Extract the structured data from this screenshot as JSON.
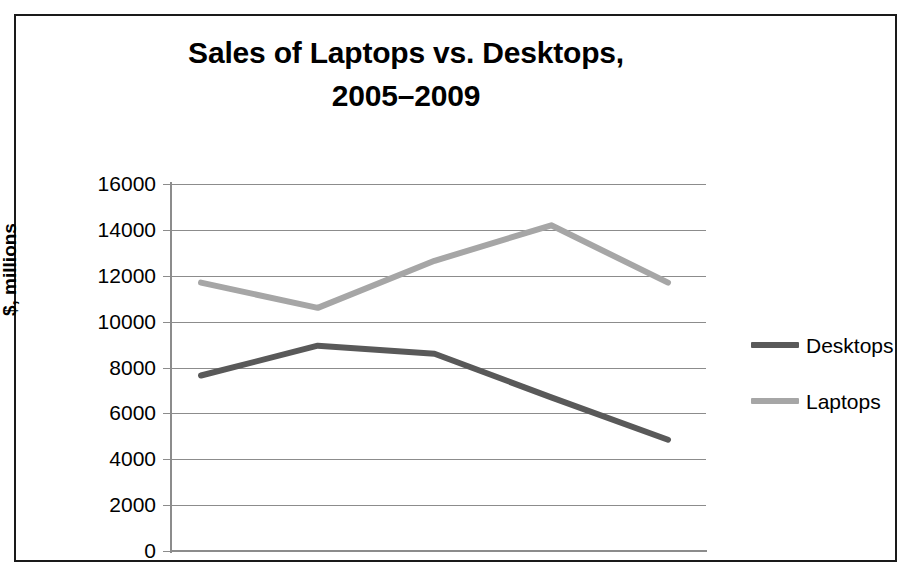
{
  "chart_data": {
    "type": "line",
    "title": "Sales of Laptops vs. Desktops, 2005–2009",
    "title_lines": [
      "Sales of Laptops vs. Desktops,",
      "2005–2009"
    ],
    "xlabel": "",
    "ylabel": "$, millions",
    "x": [
      "2005",
      "2006",
      "2007",
      "2008",
      "2009"
    ],
    "categories": [
      "2005",
      "2006",
      "2007",
      "2008",
      "2009"
    ],
    "series": [
      {
        "name": "Desktops",
        "color": "#595959",
        "values": [
          7650,
          8950,
          8600,
          6700,
          4850
        ]
      },
      {
        "name": "Laptops",
        "color": "#a6a6a6",
        "values": [
          11700,
          10600,
          12650,
          14200,
          11700
        ]
      }
    ],
    "ylim": [
      0,
      16000
    ],
    "ytick_step": 2000,
    "ytick_labels": [
      "16000",
      "14000",
      "12000",
      "10000",
      "8000",
      "6000",
      "4000",
      "2000",
      "0"
    ],
    "ytick_values": [
      16000,
      14000,
      12000,
      10000,
      8000,
      6000,
      4000,
      2000,
      0
    ],
    "xtick_labels": [],
    "grid": "horizontal",
    "legend_position": "right",
    "frame_color": "#1a1a1a",
    "grid_color": "#8c8c8c",
    "axis_color": "#8c8c8c",
    "background": "#ffffff"
  },
  "legend": {
    "items": [
      {
        "label": "Desktops",
        "color": "#595959"
      },
      {
        "label": "Laptops",
        "color": "#a6a6a6"
      }
    ]
  }
}
